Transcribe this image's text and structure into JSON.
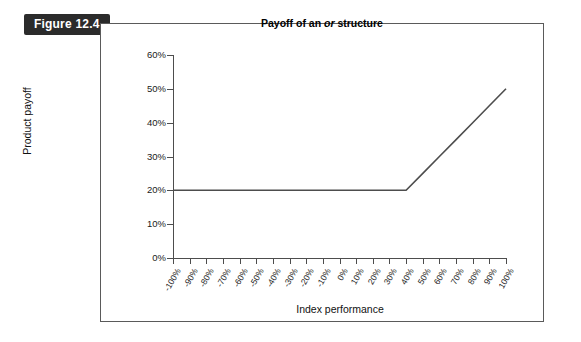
{
  "figure": {
    "badge_label": "Figure 12.4"
  },
  "chart_data": {
    "type": "line",
    "title_prefix": "Payoff of an ",
    "title_italic": "or",
    "title_suffix": " structure",
    "title": "Payoff of an or structure",
    "xlabel": "Index performance",
    "ylabel": "Product payoff",
    "grid": false,
    "legend": null,
    "xlim": [
      -100,
      100
    ],
    "ylim": [
      0,
      60
    ],
    "x_tick_labels": [
      "-100%",
      "-90%",
      "-80%",
      "-70%",
      "-60%",
      "-50%",
      "-40%",
      "-30%",
      "-20%",
      "-10%",
      "0%",
      "10%",
      "20%",
      "30%",
      "40%",
      "50%",
      "60%",
      "70%",
      "80%",
      "90%",
      "100%"
    ],
    "x_tick_values": [
      -100,
      -90,
      -80,
      -70,
      -60,
      -50,
      -40,
      -30,
      -20,
      -10,
      0,
      10,
      20,
      30,
      40,
      50,
      60,
      70,
      80,
      90,
      100
    ],
    "y_tick_labels": [
      "60%",
      "50%",
      "40%",
      "30%",
      "20%",
      "10%",
      "0%"
    ],
    "y_tick_values": [
      60,
      50,
      40,
      30,
      20,
      10,
      0
    ],
    "series": [
      {
        "name": "Product payoff",
        "color": "#4d4d4d",
        "x": [
          -100,
          -90,
          -80,
          -70,
          -60,
          -50,
          -40,
          -30,
          -20,
          -10,
          0,
          10,
          20,
          30,
          40,
          50,
          60,
          70,
          80,
          90,
          100
        ],
        "values": [
          20,
          20,
          20,
          20,
          20,
          20,
          20,
          20,
          20,
          20,
          20,
          20,
          20,
          20,
          20,
          25,
          30,
          35,
          40,
          45,
          50
        ]
      }
    ],
    "annotations": {
      "kink_x": 40,
      "kink_y": 20,
      "flat_level": 20,
      "max_payoff": 50,
      "slope_after_kink": 0.5
    }
  }
}
